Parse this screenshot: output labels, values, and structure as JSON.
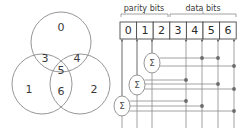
{
  "figure": {
    "stroke_color": "#8a8a8a",
    "dark_stroke_color": "#4a4a4a",
    "text_color": "#3a3a3a",
    "dot_color": "#6b6b6b"
  },
  "venn": {
    "name": "venn-diagram",
    "circles": [
      {
        "id": "top",
        "cx": 61,
        "cy": 42,
        "r": 30
      },
      {
        "id": "left",
        "cx": 42,
        "cy": 84,
        "r": 30
      },
      {
        "id": "right",
        "cx": 80,
        "cy": 84,
        "r": 30
      }
    ],
    "regions": [
      {
        "label": "0",
        "x": 61,
        "y": 28
      },
      {
        "label": "3",
        "x": 45,
        "y": 59
      },
      {
        "label": "4",
        "x": 77,
        "y": 59
      },
      {
        "label": "5",
        "x": 61,
        "y": 71
      },
      {
        "label": "1",
        "x": 29,
        "y": 90
      },
      {
        "label": "6",
        "x": 61,
        "y": 92
      },
      {
        "label": "2",
        "x": 94,
        "y": 90
      }
    ]
  },
  "circuit": {
    "name": "parity-circuit",
    "group_labels": [
      {
        "id": "parity",
        "text": "parity bits",
        "x": 144,
        "y": 8,
        "bracket_x1": 121,
        "bracket_x2": 168
      },
      {
        "id": "data",
        "text": "data bits",
        "x": 203,
        "y": 8,
        "bracket_x1": 170,
        "bracket_x2": 236
      }
    ],
    "bit_boxes": {
      "y": 22,
      "height": 17,
      "x_start": 120,
      "cell_width": 16.6,
      "cells": [
        {
          "index": 0,
          "label": "0",
          "type": "parity"
        },
        {
          "index": 1,
          "label": "1",
          "type": "parity"
        },
        {
          "index": 2,
          "label": "2",
          "type": "parity"
        },
        {
          "index": 3,
          "label": "3",
          "type": "data"
        },
        {
          "index": 4,
          "label": "4",
          "type": "data"
        },
        {
          "index": 5,
          "label": "5",
          "type": "data"
        },
        {
          "index": 6,
          "label": "6",
          "type": "data"
        }
      ]
    },
    "sum_nodes": [
      {
        "id": "sum-top",
        "symbol": "Σ",
        "cx": 152,
        "cy": 63,
        "rx": 8,
        "ry": 10,
        "output_bit": 2
      },
      {
        "id": "sum-middle",
        "symbol": "Σ",
        "cx": 137,
        "cy": 85,
        "rx": 8,
        "ry": 10,
        "output_bit": 1
      },
      {
        "id": "sum-bottom",
        "symbol": "Σ",
        "cx": 122,
        "cy": 106,
        "rx": 8,
        "ry": 10,
        "output_bit": 0
      }
    ],
    "bit_lines": [
      {
        "bit": 0,
        "x": 122
      },
      {
        "bit": 1,
        "x": 137
      },
      {
        "bit": 2,
        "x": 152
      },
      {
        "bit": 3,
        "x": 186
      },
      {
        "bit": 4,
        "x": 202
      },
      {
        "bit": 5,
        "x": 218
      },
      {
        "bit": 6,
        "x": 234
      }
    ],
    "junction_dots": [
      {
        "x": 202,
        "y": 58,
        "bit": 4
      },
      {
        "x": 218,
        "y": 58,
        "bit": 5
      },
      {
        "x": 234,
        "y": 66,
        "bit": 6
      },
      {
        "x": 186,
        "y": 80,
        "bit": 3
      },
      {
        "x": 218,
        "y": 84,
        "bit": 5
      },
      {
        "x": 234,
        "y": 89,
        "bit": 6
      },
      {
        "x": 186,
        "y": 101,
        "bit": 3
      },
      {
        "x": 202,
        "y": 106,
        "bit": 4
      },
      {
        "x": 234,
        "y": 111,
        "bit": 6
      }
    ],
    "wires": [
      {
        "from_node": "sum-top",
        "y": 58,
        "to_x": 218,
        "bits": [
          4,
          5
        ]
      },
      {
        "from_node": "sum-top",
        "y": 66,
        "to_x": 234,
        "bits": [
          6
        ]
      },
      {
        "from_node": "sum-middle",
        "y": 80,
        "to_x": 186,
        "bits": [
          3
        ]
      },
      {
        "from_node": "sum-middle",
        "y": 84,
        "to_x": 218,
        "bits": [
          5
        ]
      },
      {
        "from_node": "sum-middle",
        "y": 89,
        "to_x": 234,
        "bits": [
          6
        ]
      },
      {
        "from_node": "sum-bottom",
        "y": 101,
        "to_x": 186,
        "bits": [
          3
        ]
      },
      {
        "from_node": "sum-bottom",
        "y": 106,
        "to_x": 202,
        "bits": [
          4
        ]
      },
      {
        "from_node": "sum-bottom",
        "y": 111,
        "to_x": 234,
        "bits": [
          6
        ]
      }
    ]
  }
}
